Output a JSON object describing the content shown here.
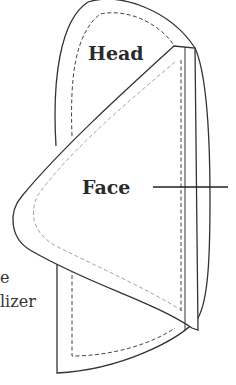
{
  "diagram": {
    "labels": {
      "head": "Head",
      "face": "Face",
      "side_line1": "e",
      "side_line2": "lizer"
    },
    "colors": {
      "outline": "#333333",
      "seam_dark": "#444444",
      "seam_light": "#999999"
    }
  }
}
